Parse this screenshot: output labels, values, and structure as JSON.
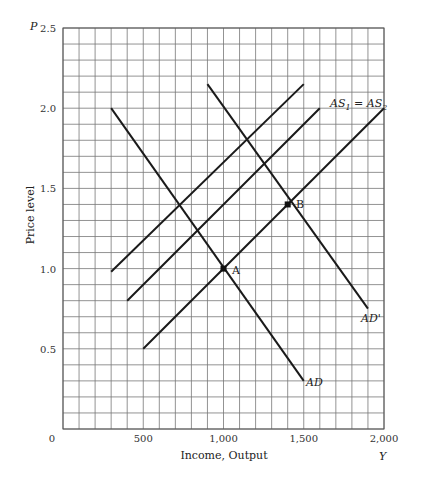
{
  "chart_data": {
    "type": "line",
    "title": "",
    "xlabel": "Income, Output",
    "ylabel": "Price level",
    "x_axis_symbol": "Y",
    "y_axis_symbol": "P",
    "xlim": [
      0,
      2000
    ],
    "ylim": [
      0,
      2.5
    ],
    "grid": true,
    "x_ticks": [
      "0",
      "500",
      "1,000",
      "1,500",
      "2,000"
    ],
    "y_ticks": [
      "2.5",
      "2.0",
      "1.5",
      "1.0",
      "0.5"
    ],
    "series": [
      {
        "name": "AD",
        "points": [
          [
            300,
            2.0
          ],
          [
            1500,
            0.3
          ]
        ]
      },
      {
        "name": "AD'",
        "points": [
          [
            900,
            2.15
          ],
          [
            1900,
            0.75
          ]
        ]
      },
      {
        "name": "AS1 = AS2",
        "points": [
          [
            500,
            0.5
          ],
          [
            2000,
            2.0
          ]
        ]
      },
      {
        "name": "AS (middle)",
        "points": [
          [
            400,
            0.8
          ],
          [
            1600,
            2.0
          ]
        ]
      },
      {
        "name": "AS (upper)",
        "points": [
          [
            300,
            0.98
          ],
          [
            1500,
            2.15
          ]
        ]
      }
    ],
    "annotations": [
      {
        "label": "A",
        "x": 1000,
        "y": 1.0
      },
      {
        "label": "B",
        "x": 1400,
        "y": 1.4
      }
    ]
  },
  "labels": {
    "p_symbol": "P",
    "y_symbol": "Y",
    "x_title": "Income, Output",
    "y_title": "Price level",
    "as_label_main": "AS",
    "as_sub1": "1",
    "as_eq": " = AS",
    "as_sub2": "2",
    "ad_label": "AD",
    "adp_label": "AD'",
    "point_a": "A",
    "point_b": "B"
  }
}
